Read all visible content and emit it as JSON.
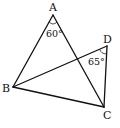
{
  "diagram": {
    "points": {
      "A": {
        "label": "A",
        "x": 53,
        "y": 15
      },
      "B": {
        "label": "B",
        "x": 13,
        "y": 87
      },
      "C": {
        "label": "C",
        "x": 104,
        "y": 107
      },
      "D": {
        "label": "D",
        "x": 107,
        "y": 46
      }
    },
    "segments": [
      "AB",
      "AC",
      "BC",
      "BD",
      "DC"
    ],
    "angles": {
      "A": {
        "value": "60°",
        "vertex": "A",
        "between": [
          "AB",
          "AC"
        ]
      },
      "D": {
        "value": "65°",
        "vertex": "D",
        "between": [
          "DB",
          "DC"
        ]
      }
    },
    "colors": {
      "stroke": "#111111",
      "background": "#ffffff"
    }
  }
}
